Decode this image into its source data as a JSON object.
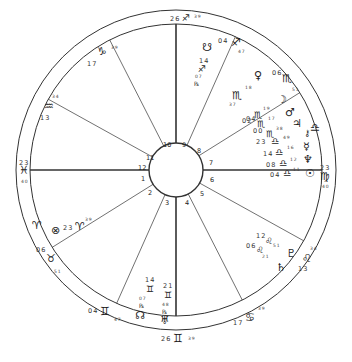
{
  "chart": {
    "type": "natal-wheel",
    "angles": {
      "ascendant": {
        "deg": "23",
        "sign_glyph": "♓",
        "min": "40"
      },
      "descendant": {
        "deg": "23",
        "sign_glyph": "♍",
        "min": "40"
      },
      "midheaven": {
        "deg": "26",
        "sign_glyph": "♐",
        "min": "39"
      },
      "imum_coeli": {
        "deg": "26",
        "sign_glyph": "♊",
        "min": "39"
      }
    },
    "house_numbers": [
      "1",
      "2",
      "3",
      "4",
      "5",
      "6",
      "7",
      "8",
      "9",
      "10",
      "11",
      "12"
    ],
    "cusps": [
      {
        "house": "11",
        "deg": "17",
        "sign_glyph": "♑",
        "min": "39"
      },
      {
        "house": "12",
        "deg": "13",
        "sign_glyph": "♒",
        "min": "34"
      },
      {
        "house": "2",
        "deg": "06",
        "sign_glyph": "♉",
        "min": "51"
      },
      {
        "house": "3",
        "deg": "04",
        "sign_glyph": "♊",
        "min": "47"
      },
      {
        "house": "5",
        "deg": "17",
        "sign_glyph": "♋",
        "min": "39"
      },
      {
        "house": "6",
        "deg": "13",
        "sign_glyph": "♌",
        "min": "34"
      },
      {
        "house": "8",
        "deg": "06",
        "sign_glyph": "♏",
        "min": "51"
      },
      {
        "house": "9",
        "deg": "04",
        "sign_glyph": "♐",
        "min": "47"
      }
    ],
    "intercepted": [
      {
        "sign_glyph": "♈"
      },
      {
        "sign_glyph": "♎"
      }
    ],
    "planets": [
      {
        "name": "south-node",
        "glyph": "☋",
        "deg": "14",
        "sign_glyph": "♐",
        "min": "07",
        "retro": "℞"
      },
      {
        "name": "venus",
        "glyph": "♀",
        "deg": "18",
        "sign_glyph": "♏",
        "min": "37"
      },
      {
        "name": "moon",
        "glyph": "☽",
        "deg": "04",
        "sign_glyph": "♏",
        "min": "19"
      },
      {
        "name": "mars",
        "glyph": "♂",
        "deg": "02",
        "sign_glyph": "♏",
        "min": "17"
      },
      {
        "name": "jupiter",
        "glyph": "♃",
        "deg": "00",
        "sign_glyph": "♏",
        "min": "38"
      },
      {
        "name": "chiron",
        "glyph": "⚷",
        "deg": "23",
        "sign_glyph": "♎",
        "min": "49"
      },
      {
        "name": "mercury",
        "glyph": "☿",
        "deg": "14",
        "sign_glyph": "♎",
        "min": "16"
      },
      {
        "name": "neptune",
        "glyph": "♆",
        "deg": "08",
        "sign_glyph": "♎",
        "min": "12"
      },
      {
        "name": "sun",
        "glyph": "☉",
        "deg": "04",
        "sign_glyph": "♎",
        "min": "11"
      },
      {
        "name": "pluto",
        "glyph": "♇",
        "deg": "12",
        "sign_glyph": "♌",
        "min": "51"
      },
      {
        "name": "saturn",
        "glyph": "♄",
        "deg": "06",
        "sign_glyph": "♌",
        "min": "21"
      },
      {
        "name": "north-node",
        "glyph": "☊",
        "deg": "14",
        "sign_glyph": "♊",
        "min": "07",
        "retro": "℞"
      },
      {
        "name": "uranus",
        "glyph": "♅",
        "deg": "21",
        "sign_glyph": "♊",
        "min": "48",
        "retro": "℞"
      },
      {
        "name": "part-of-fortune",
        "glyph": "⊗",
        "deg": "23",
        "sign_glyph": "♈",
        "min": "39"
      }
    ]
  }
}
